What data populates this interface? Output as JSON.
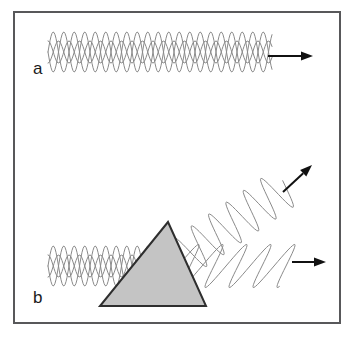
{
  "figure": {
    "background_color": "#ffffff",
    "frame": {
      "name": "figure-border",
      "x": 14,
      "y": 12,
      "width": 326,
      "height": 311,
      "stroke_color": "#58585a",
      "stroke_width": 2,
      "fill": "#ffffff"
    }
  },
  "panels": [
    {
      "id": "a",
      "label": "a",
      "label_x": 33,
      "label_y": 74,
      "description": "Unpolarized light beam travelling to the right"
    },
    {
      "id": "b",
      "label": "b",
      "label_x": 33,
      "label_y": 303,
      "description": "Unpolarized light striking a prism and splitting into two polarized beams"
    }
  ],
  "waves": [
    {
      "name": "unpolarized-wave-a",
      "panel": "a",
      "kind": "unpolarized",
      "x_start": 48,
      "x_end": 272,
      "center_y": 52,
      "amplitude": 20,
      "wavelength": 21,
      "angle_deg": 0,
      "stroke_color": "#8a8a8a",
      "stroke_width": 1
    },
    {
      "name": "unpolarized-wave-b-incoming",
      "panel": "b",
      "kind": "unpolarized",
      "x_start": 48,
      "x_end": 176,
      "center_y": 266,
      "amplitude": 20,
      "wavelength": 21,
      "angle_deg": 0,
      "stroke_color": "#8a8a8a",
      "stroke_width": 1
    },
    {
      "name": "polarized-wave-b-reflected",
      "panel": "b",
      "kind": "polarized",
      "x_start": 173,
      "x_end": 287,
      "start_y": 264,
      "end_y": 186,
      "amplitude": 21,
      "wavelength": 21,
      "angle_deg": 34,
      "stroke_color": "#8a8a8a",
      "stroke_width": 1
    },
    {
      "name": "polarized-wave-b-transmitted",
      "panel": "b",
      "kind": "polarized-skewed",
      "x_start": 178,
      "x_end": 294,
      "center_y": 266,
      "amplitude": 26,
      "wavelength": 24,
      "skew_deg": 34,
      "angle_deg": 0,
      "stroke_color": "#8a8a8a",
      "stroke_width": 1
    }
  ],
  "arrows": [
    {
      "name": "direction-arrow-a",
      "panel": "a",
      "x1": 268,
      "y1": 56,
      "x2": 313,
      "y2": 56,
      "color": "#111111",
      "stroke_width": 2,
      "head_length": 12,
      "head_width": 9
    },
    {
      "name": "direction-arrow-b-reflected",
      "panel": "b",
      "x1": 283,
      "y1": 192,
      "x2": 312,
      "y2": 165,
      "color": "#111111",
      "stroke_width": 2,
      "head_length": 12,
      "head_width": 9
    },
    {
      "name": "direction-arrow-b-transmitted",
      "panel": "b",
      "x1": 292,
      "y1": 262,
      "x2": 326,
      "y2": 262,
      "color": "#111111",
      "stroke_width": 2,
      "head_length": 12,
      "head_width": 9
    }
  ],
  "prism": {
    "name": "prism",
    "apex_x": 168,
    "apex_y": 222,
    "base_left_x": 100,
    "base_right_x": 206,
    "base_y": 306,
    "fill_color": "#c4c4c4",
    "stroke_color": "#2e2e2e",
    "stroke_width": 2
  }
}
